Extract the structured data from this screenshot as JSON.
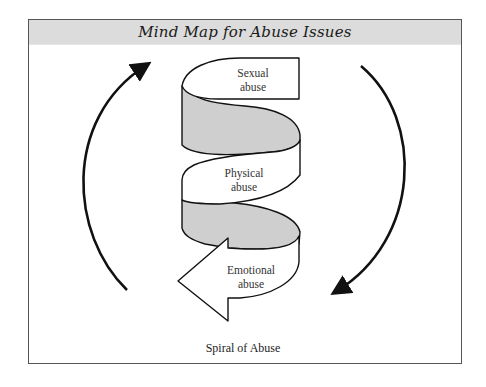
{
  "diagram": {
    "title": "Mind Map for Abuse Issues",
    "caption": "Spiral of Abuse",
    "spiral_levels": [
      {
        "line1": "Sexual",
        "line2": "abuse"
      },
      {
        "line1": "Physical",
        "line2": "abuse"
      },
      {
        "line1": "Emotional",
        "line2": "abuse"
      }
    ],
    "arrows": {
      "left": "upward-curved-arrow",
      "right": "downward-curved-arrow"
    },
    "colors": {
      "header_band": "#dcdcdc",
      "ribbon_shade": "#cfcfcf",
      "ribbon_face": "#ffffff",
      "stroke": "#111111"
    }
  }
}
